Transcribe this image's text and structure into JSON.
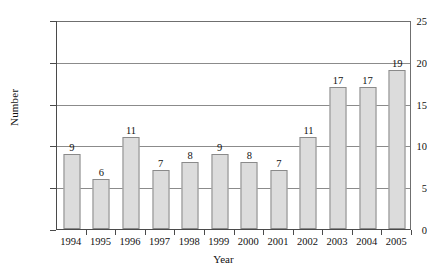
{
  "chart_data": {
    "type": "bar",
    "title": "",
    "subtitle": "",
    "xlabel": "Year",
    "ylabel": "Number",
    "categories": [
      "1994",
      "1995",
      "1996",
      "1997",
      "1998",
      "1999",
      "2000",
      "2001",
      "2002",
      "2003",
      "2004",
      "2005"
    ],
    "values": [
      9,
      6,
      11,
      7,
      8,
      9,
      8,
      7,
      11,
      17,
      17,
      19
    ],
    "data_labels": [
      "9",
      "6",
      "11",
      "7",
      "8",
      "9",
      "8",
      "7",
      "11",
      "17",
      "17",
      "19"
    ],
    "ylim": [
      0,
      25
    ],
    "y_ticks": [
      0,
      5,
      10,
      15,
      20,
      25
    ],
    "y_tick_labels": [
      "0",
      "5",
      "10",
      "15",
      "20",
      "25"
    ],
    "grid": true,
    "grid_axis": "y",
    "legend": false,
    "legend_position": "none",
    "bar_fill_color": "#dcdcdc",
    "bar_border_color": "#8a8a8a",
    "axis_color": "#4a4a4a",
    "grid_color": "#8b8b8b",
    "background_color": "#ffffff",
    "text_color": "#111111"
  }
}
